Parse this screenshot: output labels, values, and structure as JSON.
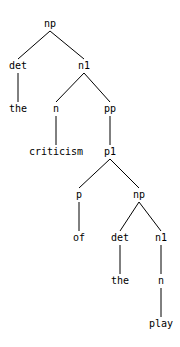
{
  "diagram": {
    "type": "parse-tree",
    "nodes": [
      {
        "id": "n0",
        "label": "np",
        "x": 50,
        "y": 24,
        "parent": null
      },
      {
        "id": "n1",
        "label": "det",
        "x": 18,
        "y": 66,
        "parent": "n0"
      },
      {
        "id": "n2",
        "label": "n1",
        "x": 84,
        "y": 66,
        "parent": "n0"
      },
      {
        "id": "n3",
        "label": "the",
        "x": 18,
        "y": 109,
        "parent": "n1"
      },
      {
        "id": "n4",
        "label": "n",
        "x": 56,
        "y": 109,
        "parent": "n2"
      },
      {
        "id": "n5",
        "label": "pp",
        "x": 110,
        "y": 109,
        "parent": "n2"
      },
      {
        "id": "n6",
        "label": "criticism",
        "x": 56,
        "y": 152,
        "parent": "n4"
      },
      {
        "id": "n7",
        "label": "p1",
        "x": 110,
        "y": 152,
        "parent": "n5"
      },
      {
        "id": "n8",
        "label": "p",
        "x": 79,
        "y": 195,
        "parent": "n7"
      },
      {
        "id": "n9",
        "label": "np",
        "x": 139,
        "y": 195,
        "parent": "n7"
      },
      {
        "id": "n10",
        "label": "of",
        "x": 79,
        "y": 238,
        "parent": "n8"
      },
      {
        "id": "n11",
        "label": "det",
        "x": 120,
        "y": 238,
        "parent": "n9"
      },
      {
        "id": "n12",
        "label": "n1",
        "x": 161,
        "y": 238,
        "parent": "n9"
      },
      {
        "id": "n13",
        "label": "the",
        "x": 120,
        "y": 281,
        "parent": "n11"
      },
      {
        "id": "n14",
        "label": "n",
        "x": 161,
        "y": 281,
        "parent": "n12"
      },
      {
        "id": "n15",
        "label": "play",
        "x": 161,
        "y": 324,
        "parent": "n14"
      }
    ],
    "colors": {
      "line": "#000000",
      "text": "#000000",
      "background": "#ffffff"
    }
  }
}
